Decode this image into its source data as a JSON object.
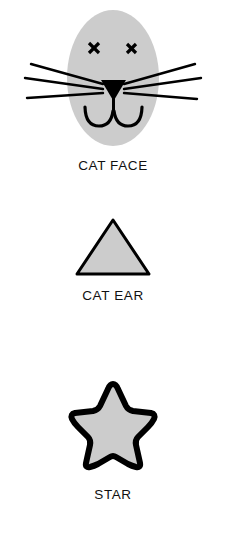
{
  "page": {
    "background_color": "#ffffff"
  },
  "palette": {
    "shape_fill": "#cccccc",
    "outline": "#000000",
    "label_text": "#111111"
  },
  "figures": [
    {
      "id": "cat-face",
      "label": "CAT FACE",
      "shape": "ellipse-face",
      "fill": "#cccccc",
      "stroke": "none",
      "features": [
        {
          "name": "left-eye",
          "glyph": "x-mark",
          "color": "#000000"
        },
        {
          "name": "right-eye",
          "glyph": "x-mark",
          "color": "#000000"
        },
        {
          "name": "nose",
          "glyph": "triangle-down",
          "color": "#000000"
        },
        {
          "name": "mouth",
          "glyph": "double-arc-smile",
          "color": "#000000"
        },
        {
          "name": "whiskers-left",
          "count": 3,
          "color": "#000000"
        },
        {
          "name": "whiskers-right",
          "count": 3,
          "color": "#000000"
        }
      ]
    },
    {
      "id": "cat-ear",
      "label": "CAT EAR",
      "shape": "triangle",
      "fill": "#cccccc",
      "stroke": "#000000",
      "stroke_width": 3
    },
    {
      "id": "star",
      "label": "STAR",
      "shape": "rounded-five-point-star",
      "fill": "#cccccc",
      "stroke": "#000000",
      "stroke_width": 6,
      "points": 5
    }
  ]
}
